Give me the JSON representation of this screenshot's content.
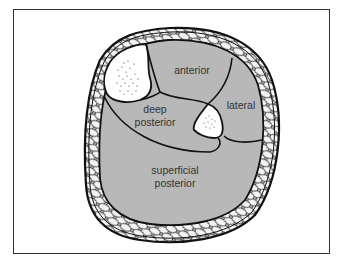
{
  "figure": {
    "type": "cross-section diagram of lower leg compartments",
    "labels": {
      "anterior": "anterior",
      "lateral": "lateral",
      "deep_posterior_line1": "deep",
      "deep_posterior_line2": "posterior",
      "superficial_posterior_line1": "superficial",
      "superficial_posterior_line2": "posterior"
    },
    "colors": {
      "compartment_fill": "#b8b8b8",
      "bone_fill": "#ffffff",
      "fat_fill": "#eeeeee",
      "outline": "#111111",
      "label_text": "#333333",
      "frame_border": "#333333"
    }
  }
}
